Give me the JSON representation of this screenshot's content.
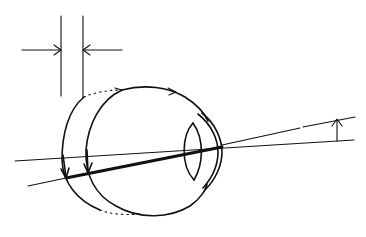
{
  "figure": {
    "title": "",
    "colors": {
      "ink": "#111111",
      "background": "#ffffff"
    }
  },
  "elements": {
    "displacement_marker": {
      "type": "dimension-arrows",
      "label": ""
    },
    "eye_outline_displaced": {
      "type": "arc-dotted",
      "label": ""
    },
    "eye_outline": {
      "type": "arc",
      "label": ""
    },
    "lens": {
      "type": "biconvex-lens",
      "label": ""
    },
    "cornea": {
      "type": "double-arc",
      "label": ""
    },
    "visual_axis": {
      "type": "line",
      "label": ""
    },
    "deviated_ray": {
      "type": "line",
      "label": ""
    },
    "angle_marker": {
      "type": "arrow",
      "label": ""
    }
  }
}
